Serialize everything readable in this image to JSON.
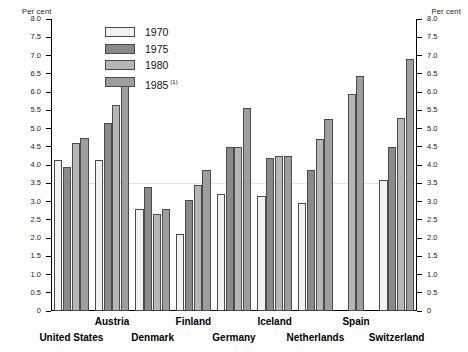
{
  "axis": {
    "left_caption": "Per cent",
    "right_caption": "Per cent",
    "tick_labels": [
      "8.0",
      "7.5",
      "7.0",
      "6.5",
      "6.0",
      "5.5",
      "5.0",
      "4.5",
      "4.0",
      "3.5",
      "3.0",
      "2.5",
      "2.0",
      "1.5",
      "1.0",
      "0.5",
      "0"
    ]
  },
  "legend": {
    "items": [
      {
        "label": "1970",
        "color": "#f2f2f2",
        "note": ""
      },
      {
        "label": "1975",
        "color": "#8a8a8a",
        "note": ""
      },
      {
        "label": "1980",
        "color": "#b6b6b6",
        "note": ""
      },
      {
        "label": "1985",
        "color": "#9e9e9e",
        "note": "(1)"
      }
    ]
  },
  "categories": [
    {
      "name": "United States",
      "row": "bottom"
    },
    {
      "name": "Austria",
      "row": "top"
    },
    {
      "name": "Denmark",
      "row": "bottom"
    },
    {
      "name": "Finland",
      "row": "top"
    },
    {
      "name": "Germany",
      "row": "bottom"
    },
    {
      "name": "Iceland",
      "row": "top"
    },
    {
      "name": "Netherlands",
      "row": "bottom"
    },
    {
      "name": "Spain",
      "row": "top"
    },
    {
      "name": "Switzerland",
      "row": "bottom"
    }
  ],
  "chart_data": {
    "type": "bar",
    "title": "",
    "xlabel": "",
    "ylabel": "Per cent",
    "ylim": [
      0,
      8.0
    ],
    "ytick_step": 0.5,
    "grid": false,
    "legend_position": "top-left-inside",
    "footnote": "(1)",
    "categories": [
      "United States",
      "Austria",
      "Denmark",
      "Finland",
      "Germany",
      "Iceland",
      "Netherlands",
      "Spain",
      "Switzerland"
    ],
    "series": [
      {
        "name": "1970",
        "color": "#f2f2f2",
        "values": [
          4.15,
          4.15,
          2.8,
          2.1,
          3.2,
          3.15,
          2.95,
          null,
          3.6
        ]
      },
      {
        "name": "1975",
        "color": "#8a8a8a",
        "values": [
          3.95,
          5.15,
          3.4,
          3.05,
          4.5,
          4.2,
          3.85,
          null,
          4.5
        ]
      },
      {
        "name": "1980",
        "color": "#b6b6b6",
        "values": [
          4.6,
          5.65,
          2.65,
          3.45,
          4.5,
          4.25,
          4.7,
          5.95,
          5.3
        ]
      },
      {
        "name": "1985",
        "color": "#9e9e9e",
        "values": [
          4.75,
          6.2,
          2.8,
          3.85,
          5.55,
          4.25,
          5.25,
          6.45,
          6.9
        ]
      }
    ]
  }
}
